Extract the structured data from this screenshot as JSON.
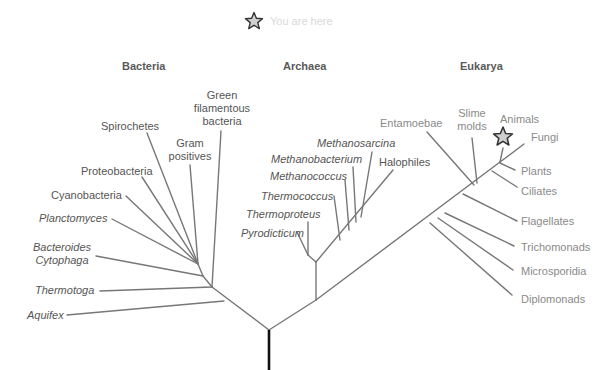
{
  "legend": {
    "icon": "star-icon",
    "text": "You are here"
  },
  "domains": {
    "bacteria": "Bacteria",
    "archaea": "Archaea",
    "eukarya": "Eukarya"
  },
  "bacteria": {
    "green": [
      "Green",
      "filamentous",
      "bacteria"
    ],
    "spirochetes": "Spirochetes",
    "gram": [
      "Gram",
      "positives"
    ],
    "proteobacteria": "Proteobacteria",
    "cyanobacteria": "Cyanobacteria",
    "planctomyces": "Planctomyces",
    "bacteroides": [
      "Bacteroides",
      "Cytophaga"
    ],
    "thermotoga": "Thermotoga",
    "aquifex": "Aquifex"
  },
  "archaea": {
    "methanosarcina": "Methanosarcina",
    "methanobacterium": "Methanobacterium",
    "methanococcus": "Methanococcus",
    "halophiles": "Halophiles",
    "thermococcus": "Thermococcus",
    "thermoproteus": "Thermoproteus",
    "pyrodicticum": "Pyrodicticum"
  },
  "eukarya": {
    "entamoebae": "Entamoebae",
    "slime": [
      "Slime",
      "molds"
    ],
    "animals": "Animals",
    "fungi": "Fungi",
    "plants": "Plants",
    "ciliates": "Ciliates",
    "flagellates": "Flagellates",
    "trichomonads": "Trichomonads",
    "microsporidia": "Microsporidia",
    "diplomonads": "Diplomonads"
  },
  "colors": {
    "branch": "#777777",
    "root": "#111111",
    "star_fill": "#cfcfcf",
    "star_stroke": "#333333"
  }
}
